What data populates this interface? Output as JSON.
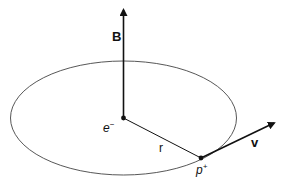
{
  "diagram": {
    "labels": {
      "magnetic_field": "B",
      "electron": "e",
      "electron_sup": "−",
      "radius": "r",
      "velocity": "v",
      "proton": "p",
      "proton_sup": "+"
    },
    "colors": {
      "stroke": "#111111",
      "orbit": "#444444",
      "background": "#ffffff"
    }
  }
}
